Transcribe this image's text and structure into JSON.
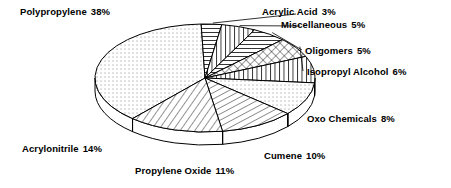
{
  "chart_data": {
    "type": "pie",
    "title": "",
    "subtitle": "",
    "xlabel": "",
    "ylabel": "",
    "legend_position": "around-slices",
    "grid": false,
    "style": "3d-exploded-outline",
    "units": "percent",
    "total": 100,
    "categories": [
      "Polypropylene",
      "Acrylic Acid",
      "Miscellaneous",
      "Oligomers",
      "Isopropyl Alcohol",
      "Oxo Chemicals",
      "Cumene",
      "Propylene Oxide",
      "Acrylonitrile"
    ],
    "values": [
      38,
      3,
      5,
      5,
      6,
      8,
      10,
      11,
      14
    ],
    "slices": [
      {
        "name": "Polypropylene",
        "value": 38,
        "label": "Polypropylene",
        "percent_text": "38%",
        "pattern": "dots",
        "start_angle": 92,
        "end_angle": 228.8
      },
      {
        "name": "Acrylic Acid",
        "value": 3,
        "label": "Acrylic Acid",
        "percent_text": "3%",
        "pattern": "horizontal-lines",
        "start_angle": 81.2,
        "end_angle": 92
      },
      {
        "name": "Miscellaneous",
        "value": 5,
        "label": "Miscellaneous",
        "percent_text": "5%",
        "pattern": "vertical-lines",
        "start_angle": 63.2,
        "end_angle": 81.2
      },
      {
        "name": "Oligomers",
        "value": 5,
        "label": "Oligomers",
        "percent_text": "5%",
        "pattern": "horizontal-lines",
        "start_angle": 45.2,
        "end_angle": 63.2
      },
      {
        "name": "Isopropyl Alcohol",
        "value": 6,
        "label": "Isopropyl Alcohol",
        "percent_text": "6%",
        "pattern": "diamond-crosshatch",
        "start_angle": 23.6,
        "end_angle": 45.2
      },
      {
        "name": "Oxo Chemicals",
        "value": 8,
        "label": "Oxo Chemicals",
        "percent_text": "8%",
        "pattern": "vertical-lines",
        "start_angle": -5.2,
        "end_angle": 23.6
      },
      {
        "name": "Cumene",
        "value": 10,
        "label": "Cumene",
        "percent_text": "10%",
        "pattern": "dots",
        "start_angle": -41.2,
        "end_angle": -5.2
      },
      {
        "name": "Propylene Oxide",
        "value": 11,
        "label": "Propylene Oxide",
        "percent_text": "11%",
        "pattern": "diagonal-lines-steep",
        "start_angle": -80.8,
        "end_angle": -41.2
      },
      {
        "name": "Acrylonitrile",
        "value": 14,
        "label": "Acrylonitrile",
        "percent_text": "14%",
        "pattern": "diagonal-lines",
        "start_angle": -131.2,
        "end_angle": -80.8
      }
    ],
    "colors": {
      "outline": "#000000",
      "fill": "#ffffff",
      "pattern": "#000000",
      "background": "#ffffff",
      "text": "#000000"
    }
  },
  "labels": {
    "polypropylene": {
      "name": "Polypropylene",
      "percent": "38%"
    },
    "acrylic_acid": {
      "name": "Acrylic Acid",
      "percent": "3%"
    },
    "miscellaneous": {
      "name": "Miscellaneous",
      "percent": "5%"
    },
    "oligomers": {
      "name": "Oligomers",
      "percent": "5%"
    },
    "isopropyl_alcohol": {
      "name": "Isopropyl Alcohol",
      "percent": "6%"
    },
    "oxo_chemicals": {
      "name": "Oxo Chemicals",
      "percent": "8%"
    },
    "cumene": {
      "name": "Cumene",
      "percent": "10%"
    },
    "propylene_oxide": {
      "name": "Propylene Oxide",
      "percent": "11%"
    },
    "acrylonitrile": {
      "name": "Acrylonitrile",
      "percent": "14%"
    }
  }
}
